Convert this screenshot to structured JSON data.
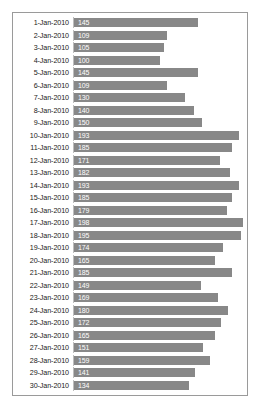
{
  "chart_data": {
    "type": "bar",
    "orientation": "horizontal",
    "title": "",
    "subtitle": "",
    "xlabel": "",
    "ylabel": "",
    "grid": false,
    "legend": false,
    "axis_line": "vertical-left",
    "xlim": [
      0,
      200
    ],
    "data_labels": true,
    "data_label_position": "inside-start",
    "bar_color": "#888888",
    "border_color": "#9a9a9a",
    "axis_color": "#bdbdbd",
    "label_text_color": "#ffffff",
    "category_text_color": "#1a1a1a",
    "categories": [
      "1-Jan-2010",
      "2-Jan-2010",
      "3-Jan-2010",
      "4-Jan-2010",
      "5-Jan-2010",
      "6-Jan-2010",
      "7-Jan-2010",
      "8-Jan-2010",
      "9-Jan-2010",
      "10-Jan-2010",
      "11-Jan-2010",
      "12-Jan-2010",
      "13-Jan-2010",
      "14-Jan-2010",
      "15-Jan-2010",
      "16-Jan-2010",
      "17-Jan-2010",
      "18-Jan-2010",
      "19-Jan-2010",
      "20-Jan-2010",
      "21-Jan-2010",
      "22-Jan-2010",
      "23-Jan-2010",
      "24-Jan-2010",
      "25-Jan-2010",
      "26-Jan-2010",
      "27-Jan-2010",
      "28-Jan-2010",
      "29-Jan-2010",
      "30-Jan-2010"
    ],
    "values": [
      145,
      109,
      105,
      100,
      145,
      109,
      130,
      140,
      150,
      193,
      185,
      171,
      182,
      193,
      185,
      179,
      198,
      195,
      174,
      165,
      185,
      149,
      169,
      180,
      172,
      165,
      151,
      159,
      141,
      134
    ],
    "value_labels": [
      "145",
      "109",
      "105",
      "100",
      "145",
      "109",
      "130",
      "140",
      "150",
      "193",
      "185",
      "171",
      "182",
      "193",
      "185",
      "179",
      "198",
      "195",
      "174",
      "165",
      "185",
      "149",
      "169",
      "180",
      "172",
      "165",
      "151",
      "159",
      "141",
      "134"
    ]
  }
}
